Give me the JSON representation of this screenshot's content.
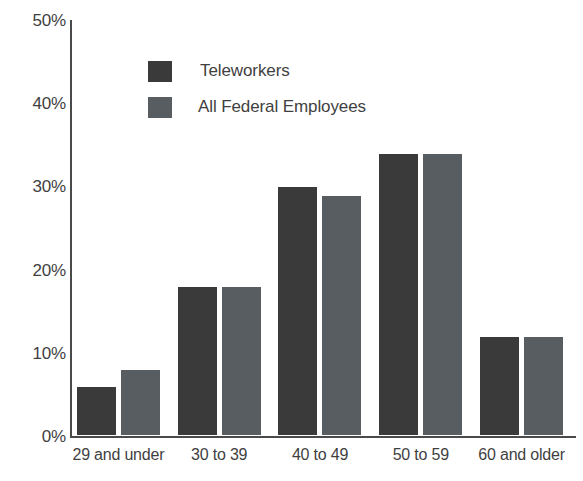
{
  "chart_data": {
    "type": "bar",
    "title": "",
    "subtitle": "",
    "xlabel": "",
    "ylabel": "",
    "ylim": [
      0,
      50
    ],
    "y_tick_labels": [
      "50%",
      "40%",
      "30%",
      "20%",
      "10%",
      "0%"
    ],
    "y_tick_values": [
      50,
      40,
      30,
      20,
      10,
      0
    ],
    "grid": false,
    "legend_position": "top-left-inside",
    "categories": [
      "29 and under",
      "30 to 39",
      "40 to 49",
      "50 to 59",
      "60 and older"
    ],
    "series": [
      {
        "name": "Teleworkers",
        "color": "#3a3a3a",
        "values": [
          6,
          18,
          30,
          34,
          12
        ]
      },
      {
        "name": "All Federal Employees",
        "color": "#575d60",
        "values": [
          8,
          18,
          29,
          34,
          12
        ]
      }
    ],
    "annotations": []
  },
  "legend": {
    "items": [
      {
        "label": "Teleworkers",
        "swatch_name": "legend-swatch-teleworkers"
      },
      {
        "label": "All Federal Employees",
        "swatch_name": "legend-swatch-all-federal-employees"
      }
    ]
  },
  "colors": {
    "axis": "#4a4a4a",
    "text": "#3f3f3f",
    "background": "#ffffff",
    "series_dark": "#3a3a3a",
    "series_light": "#575d60"
  }
}
